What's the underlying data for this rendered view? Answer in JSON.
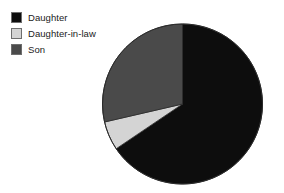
{
  "chart_data": {
    "type": "pie",
    "title": "",
    "labels": [
      "Daughter",
      "Daughter-in-law",
      "Son"
    ],
    "values": [
      65.5,
      5.8,
      28.7
    ],
    "units": "percent",
    "colors": [
      "#0d0d0d",
      "#d4d4d4",
      "#4a4a4a"
    ],
    "start_angle_deg": 0,
    "direction": "clockwise",
    "legend_position": "top-left",
    "grid": false,
    "slices": [
      {
        "label": "Daughter",
        "value": 65.5,
        "color": "#0d0d0d",
        "start_deg": 0,
        "end_deg": 236
      },
      {
        "label": "Daughter-in-law",
        "value": 5.8,
        "color": "#d4d4d4",
        "start_deg": 236,
        "end_deg": 257
      },
      {
        "label": "Son",
        "value": 28.7,
        "color": "#4a4a4a",
        "start_deg": 257,
        "end_deg": 360
      }
    ]
  },
  "legend": {
    "items": [
      {
        "label": "Daughter",
        "color": "#0d0d0d",
        "swatch_name": "legend-swatch-daughter"
      },
      {
        "label": "Daughter-in-law",
        "color": "#d4d4d4",
        "swatch_name": "legend-swatch-daughter-in-law"
      },
      {
        "label": "Son",
        "color": "#4a4a4a",
        "swatch_name": "legend-swatch-son"
      }
    ]
  },
  "pie_geometry": {
    "center_x": 182.5,
    "center_y": 104,
    "radius": 80,
    "outline_color": "#2a2a2a"
  },
  "canvas": {
    "width": 284,
    "height": 193,
    "background": "#ffffff"
  }
}
